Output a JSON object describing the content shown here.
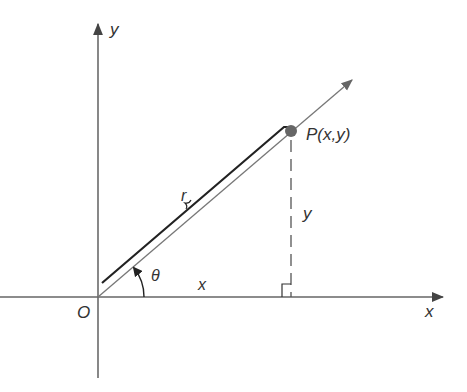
{
  "diagram": {
    "title": "",
    "labels": {
      "y_axis": "y",
      "x_axis": "x",
      "origin": "O",
      "point": "P(x,y)",
      "radius": "r",
      "angle": "θ",
      "x_leg": "x",
      "y_leg": "y"
    },
    "colors": {
      "axis": "#555555",
      "ray": "#777777",
      "r_segment": "#222222",
      "point": "#666666",
      "dashed": "#555555",
      "text": "#333333"
    }
  }
}
